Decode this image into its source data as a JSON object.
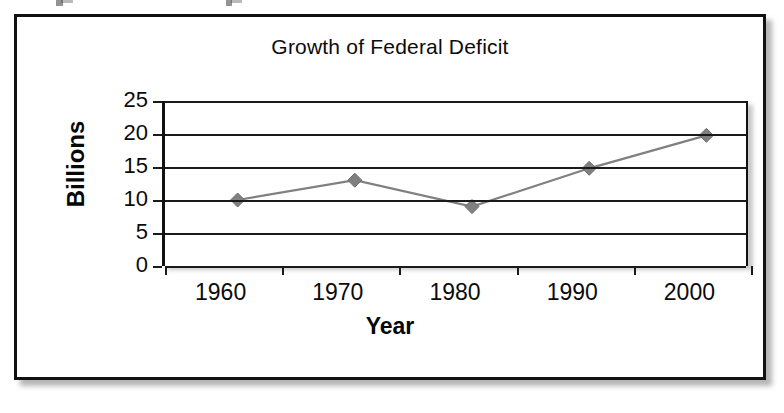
{
  "figure": {
    "title": "Growth of Federal Deficit"
  },
  "chart_data": {
    "type": "line",
    "title": "Growth of Federal Deficit",
    "xlabel": "Year",
    "ylabel": "Billions",
    "categories": [
      "1960",
      "1970",
      "1980",
      "1990",
      "2000"
    ],
    "values": [
      10,
      13,
      9,
      14.8,
      19.8
    ],
    "series": [
      {
        "name": "Federal Deficit",
        "values": [
          10,
          13,
          9,
          14.8,
          19.8
        ],
        "color": "#808080",
        "marker": "diamond"
      }
    ],
    "ylim": [
      0,
      25
    ],
    "yticks": [
      0,
      5,
      10,
      15,
      20,
      25
    ],
    "ytick_labels": [
      "0",
      "5",
      "10",
      "15",
      "20",
      "25"
    ],
    "grid": "horizontal",
    "legend": "none",
    "line_color": "#808080",
    "marker_color": "#808080",
    "axis_color": "#1a1a1a"
  }
}
